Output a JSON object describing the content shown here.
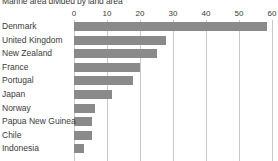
{
  "chart_data": {
    "type": "bar",
    "orientation": "horizontal",
    "title": "Marine area divided by land area",
    "xlabel": "",
    "ylabel": "",
    "xlim": [
      0,
      60
    ],
    "xticks": [
      0,
      10,
      20,
      30,
      40,
      50,
      60
    ],
    "xtick_labels": [
      "0",
      "10",
      "20",
      "30",
      "40",
      "50",
      "60"
    ],
    "grid": true,
    "legend": false,
    "bar_color": "#8a8a8a",
    "gridline_color": "#c9c9c9",
    "text_color": "#3b3b3b",
    "background_color": "#ffffff",
    "categories": [
      "Denmark",
      "United Kingdom",
      "New Zealand",
      "France",
      "Portugal",
      "Japan",
      "Norway",
      "Papua New Guinea",
      "Chile",
      "Indonesia"
    ],
    "values": [
      58.5,
      28,
      25,
      20,
      18,
      11.5,
      6.5,
      5.5,
      5.5,
      3
    ]
  }
}
